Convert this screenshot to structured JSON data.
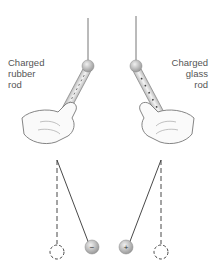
{
  "labels": {
    "left": [
      "Charged",
      "rubber",
      "rod"
    ],
    "right": [
      "Charged",
      "glass",
      "rod"
    ]
  },
  "balls": {
    "left_charge": "−",
    "right_charge": "+"
  },
  "colors": {
    "thread": "#555555",
    "rod_fill": "#d9d9d9",
    "ball_fill": "#c9c9c9",
    "hand_outline": "#777777",
    "dashed": "#333333"
  }
}
